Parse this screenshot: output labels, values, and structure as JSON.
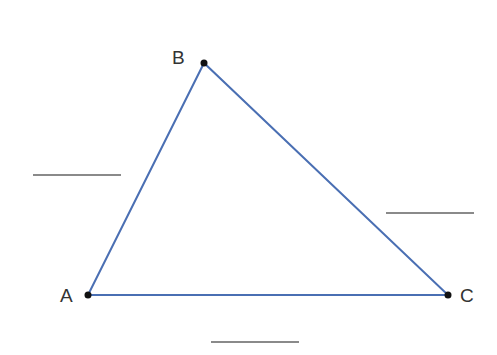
{
  "diagram": {
    "type": "triangle",
    "stroke_color": "#4a6fb3",
    "vertices": [
      {
        "label": "A",
        "x": 88,
        "y": 295
      },
      {
        "label": "B",
        "x": 204,
        "y": 63
      },
      {
        "label": "C",
        "x": 448,
        "y": 295
      }
    ],
    "blanks": [
      {
        "side": "AB",
        "text": ""
      },
      {
        "side": "BC",
        "text": ""
      },
      {
        "side": "AC",
        "text": ""
      }
    ]
  }
}
